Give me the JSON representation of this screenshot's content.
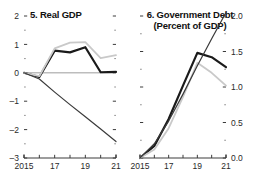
{
  "figure": {
    "background": "#ffffff",
    "panel_count": 2
  },
  "chart_data": [
    {
      "type": "line",
      "panel_id": "5",
      "title": "5. Real GDP",
      "subtitle": "",
      "xlabel": "",
      "ylabel": "",
      "x": [
        2015,
        2016,
        2017,
        2018,
        2019,
        2020,
        2021
      ],
      "xticklabels": [
        "2015",
        "",
        "17",
        "",
        "19",
        "",
        "21"
      ],
      "xlim": [
        2015,
        2021
      ],
      "ylim": [
        -3,
        2
      ],
      "yticks": [
        -3,
        -2,
        -1,
        0,
        1,
        2
      ],
      "yticklabels": [
        "–3",
        "–2",
        "–1",
        "0",
        "1",
        "2"
      ],
      "ytick_side": "left",
      "minor_ticks": true,
      "grid": false,
      "zero_line": true,
      "legend": "none",
      "series": [
        {
          "name": "series-dark-bold",
          "color": "#1a1a1a",
          "width": 2.2,
          "values": [
            0,
            -0.15,
            0.78,
            0.72,
            0.9,
            0.02,
            0.03
          ]
        },
        {
          "name": "series-light-gray",
          "color": "#c9c9c9",
          "width": 1.8,
          "values": [
            0,
            -0.12,
            0.86,
            1.06,
            1.08,
            0.52,
            0.62
          ]
        },
        {
          "name": "series-thin-dark",
          "color": "#3a3a3a",
          "width": 1.2,
          "values": [
            0,
            -0.22,
            -0.68,
            -1.12,
            -1.55,
            -1.98,
            -2.42
          ]
        }
      ]
    },
    {
      "type": "line",
      "panel_id": "6",
      "title": "6. Government Debt",
      "subtitle": "(Percent of GDP)",
      "xlabel": "",
      "ylabel": "",
      "x": [
        2015,
        2016,
        2017,
        2018,
        2019,
        2020,
        2021
      ],
      "xticklabels": [
        "2015",
        "",
        "17",
        "",
        "19",
        "",
        "21"
      ],
      "xlim": [
        2015,
        2021
      ],
      "ylim": [
        0.0,
        2.0
      ],
      "yticks": [
        0.0,
        0.5,
        1.0,
        1.5,
        2.0
      ],
      "yticklabels": [
        "0.0",
        "0.5",
        "1.0",
        "1.5",
        "2.0"
      ],
      "ytick_side": "right",
      "minor_ticks": true,
      "grid": false,
      "zero_line": false,
      "legend": "none",
      "series": [
        {
          "name": "series-dark-bold",
          "color": "#1a1a1a",
          "width": 2.2,
          "values": [
            0.0,
            0.17,
            0.55,
            1.02,
            1.48,
            1.42,
            1.28
          ]
        },
        {
          "name": "series-light-gray",
          "color": "#c9c9c9",
          "width": 1.8,
          "values": [
            0.0,
            0.12,
            0.42,
            0.86,
            1.34,
            1.2,
            1.02
          ]
        },
        {
          "name": "series-thin-dark",
          "color": "#3a3a3a",
          "width": 1.2,
          "values": [
            0.0,
            0.2,
            0.52,
            0.9,
            1.3,
            1.68,
            2.05
          ]
        }
      ]
    }
  ]
}
